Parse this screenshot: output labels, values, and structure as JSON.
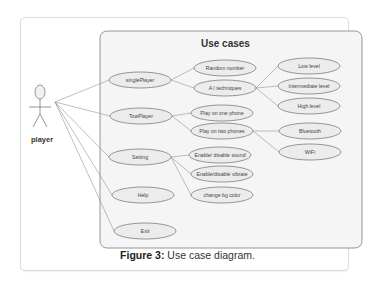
{
  "diagram": {
    "title": "Use cases",
    "actor": {
      "label": "player"
    },
    "primary_use_cases": [
      {
        "id": "singlePlayer",
        "label": "singlePlayer",
        "cx": 140,
        "cy": 80
      },
      {
        "id": "TowPlayer",
        "label": "TowPlayer",
        "cx": 141,
        "cy": 116
      },
      {
        "id": "Setting",
        "label": "Setting",
        "cx": 140,
        "cy": 157
      },
      {
        "id": "Help",
        "label": "Help",
        "cx": 143,
        "cy": 195
      },
      {
        "id": "Exit",
        "label": "Exit",
        "cx": 145,
        "cy": 231
      }
    ],
    "secondary_use_cases": [
      {
        "id": "random",
        "label": "Random number",
        "cx": 225,
        "cy": 68,
        "parent": "singlePlayer"
      },
      {
        "id": "ai",
        "label": "A I techniques",
        "cx": 225,
        "cy": 88,
        "parent": "singlePlayer"
      },
      {
        "id": "onephone",
        "label": "Play on one phone",
        "cx": 222,
        "cy": 113,
        "parent": "TowPlayer"
      },
      {
        "id": "twophones",
        "label": "Play on two phones",
        "cx": 222,
        "cy": 131,
        "parent": "TowPlayer"
      },
      {
        "id": "sound",
        "label": "Enable/ disable sound",
        "cx": 220,
        "cy": 155,
        "parent": "Setting"
      },
      {
        "id": "vibrate",
        "label": "Enable/disable vibrate",
        "cx": 222,
        "cy": 174,
        "parent": "Setting"
      },
      {
        "id": "bgcolor",
        "label": "change bg color",
        "cx": 222,
        "cy": 195,
        "parent": "Setting"
      }
    ],
    "tertiary_use_cases": [
      {
        "id": "low",
        "label": "Low level",
        "cx": 309,
        "cy": 66,
        "parent": "ai"
      },
      {
        "id": "intermediate",
        "label": "Intermediate level",
        "cx": 309,
        "cy": 86,
        "parent": "ai"
      },
      {
        "id": "high",
        "label": "High level",
        "cx": 309,
        "cy": 106,
        "parent": "ai"
      },
      {
        "id": "bluetooth",
        "label": "Bluetooth",
        "cx": 310,
        "cy": 131,
        "parent": "twophones"
      },
      {
        "id": "wifi",
        "label": "WiFi",
        "cx": 310,
        "cy": 152,
        "parent": "twophones"
      }
    ]
  },
  "caption": {
    "prefix": "Figure 3:",
    "text": " Use case diagram."
  }
}
